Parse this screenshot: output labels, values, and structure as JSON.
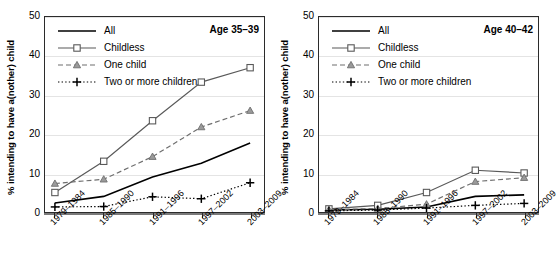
{
  "figure": {
    "width": 547,
    "height": 279,
    "background": "#ffffff"
  },
  "chart_data": [
    {
      "type": "line",
      "title": "Age 35–39",
      "panel": "left",
      "xlabel": "",
      "ylabel": "% intending to have a(nother) child",
      "categories": [
        "1979–1984",
        "1985–1990",
        "1991–1996",
        "1997–2002",
        "2003–2009"
      ],
      "ylim": [
        0,
        50
      ],
      "yticks": [
        0,
        10,
        20,
        30,
        40,
        50
      ],
      "grid": true,
      "legend_position": "top-left",
      "series": [
        {
          "name": "All",
          "values": [
            2.3,
            4.0,
            9.0,
            12.5,
            17.7
          ],
          "color": "#000000",
          "style": "solid",
          "marker": "none"
        },
        {
          "name": "Childless",
          "values": [
            5.0,
            13.0,
            23.4,
            33.3,
            37.0
          ],
          "color": "#595959",
          "style": "solid",
          "marker": "square-open"
        },
        {
          "name": "One child",
          "values": [
            7.3,
            8.4,
            14.2,
            21.8,
            26.0
          ],
          "color": "#6e6e6e",
          "style": "dashed",
          "marker": "triangle"
        },
        {
          "name": "Two or more children",
          "values": [
            1.3,
            1.4,
            3.9,
            3.4,
            7.5
          ],
          "color": "#000000",
          "style": "dotted",
          "marker": "plus"
        }
      ]
    },
    {
      "type": "line",
      "title": "Age 40–42",
      "panel": "right",
      "xlabel": "",
      "ylabel": "% intending to have a(nother) child",
      "categories": [
        "1979–1984",
        "1985–1990",
        "1991–1996",
        "1997–2002",
        "2003–2009"
      ],
      "ylim": [
        0,
        50
      ],
      "yticks": [
        0,
        10,
        20,
        30,
        40,
        50
      ],
      "grid": true,
      "legend_position": "top-left",
      "series": [
        {
          "name": "All",
          "values": [
            0.5,
            0.7,
            1.3,
            4.0,
            4.4
          ],
          "color": "#000000",
          "style": "solid",
          "marker": "none"
        },
        {
          "name": "Childless",
          "values": [
            0.8,
            1.7,
            5.0,
            10.7,
            10.0
          ],
          "color": "#595959",
          "style": "solid",
          "marker": "square-open"
        },
        {
          "name": "One child",
          "values": [
            0.6,
            0.9,
            2.0,
            7.8,
            8.8
          ],
          "color": "#6e6e6e",
          "style": "dashed",
          "marker": "triangle"
        },
        {
          "name": "Two or more children",
          "values": [
            0.3,
            0.5,
            1.0,
            1.7,
            2.2
          ],
          "color": "#000000",
          "style": "dotted",
          "marker": "plus"
        }
      ]
    }
  ]
}
